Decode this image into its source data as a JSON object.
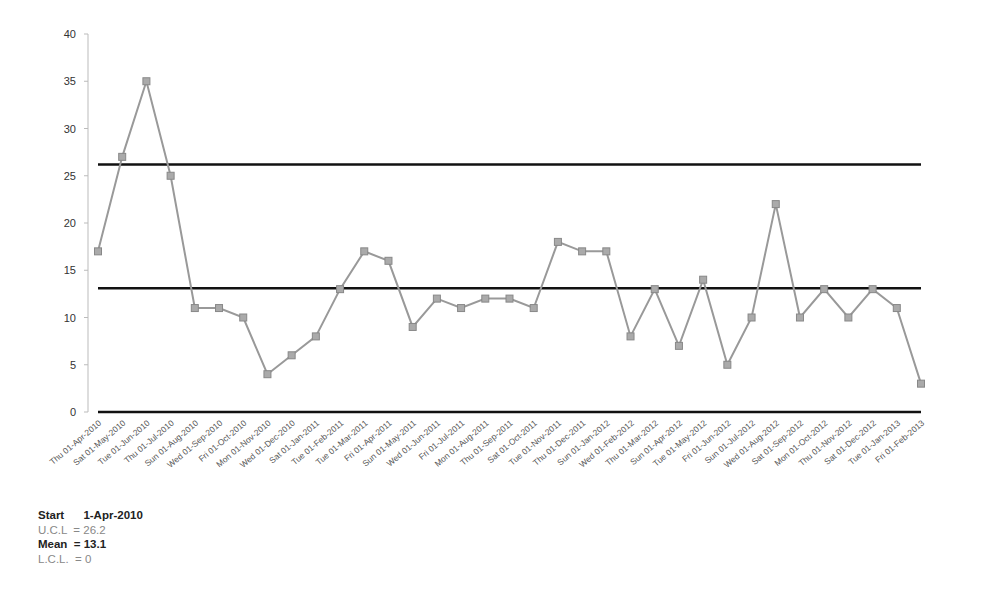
{
  "chart_data": {
    "type": "line",
    "title": "",
    "xlabel": "",
    "ylabel": "",
    "ylim": [
      0,
      40
    ],
    "yticks": [
      0,
      5,
      10,
      15,
      20,
      25,
      30,
      35,
      40
    ],
    "grid": false,
    "legend": null,
    "categories": [
      "Thu 01-Apr-2010",
      "Sat 01-May-2010",
      "Tue 01-Jun-2010",
      "Thu 01-Jul-2010",
      "Sun 01-Aug-2010",
      "Wed 01-Sep-2010",
      "Fri 01-Oct-2010",
      "Mon 01-Nov-2010",
      "Wed 01-Dec-2010",
      "Sat 01-Jan-2011",
      "Tue 01-Feb-2011",
      "Tue 01-Mar-2011",
      "Fri 01-Apr-2011",
      "Sun 01-May-2011",
      "Wed 01-Jun-2011",
      "Fri 01-Jul-2011",
      "Mon 01-Aug-2011",
      "Thu 01-Sep-2011",
      "Sat 01-Oct-2011",
      "Tue 01-Nov-2011",
      "Thu 01-Dec-2011",
      "Sun 01-Jan-2012",
      "Wed 01-Feb-2012",
      "Thu 01-Mar-2012",
      "Sun 01-Apr-2012",
      "Tue 01-May-2012",
      "Fri 01-Jun-2012",
      "Sun 01-Jul-2012",
      "Wed 01-Aug-2012",
      "Sat 01-Sep-2012",
      "Mon 01-Oct-2012",
      "Thu 01-Nov-2012",
      "Sat 01-Dec-2012",
      "Tue 01-Jan-2013",
      "Fri 01-Feb-2013"
    ],
    "series": [
      {
        "name": "Value",
        "color": "#999999",
        "values": [
          17,
          27,
          35,
          25,
          11,
          11,
          10,
          4,
          6,
          8,
          13,
          17,
          16,
          9,
          12,
          11,
          12,
          12,
          11,
          18,
          17,
          17,
          8,
          13,
          7,
          14,
          5,
          10,
          22,
          10,
          13,
          10,
          13,
          11,
          3
        ]
      },
      {
        "name": "U.C.L",
        "color": "#111111",
        "constant": 26.2
      },
      {
        "name": "Mean",
        "color": "#111111",
        "constant": 13.1
      },
      {
        "name": "L.C.L.",
        "color": "#111111",
        "constant": 0
      }
    ]
  },
  "footer": {
    "start_label": "Start",
    "start_value": "1-Apr-2010",
    "ucl_text": "U.C.L  = 26.2",
    "mean_text": "Mean  = 13.1",
    "lcl_text": "L.C.L.  = 0"
  }
}
